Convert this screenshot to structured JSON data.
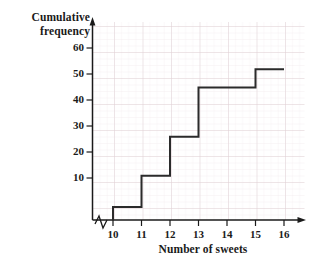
{
  "chart_data": {
    "type": "line",
    "subtype": "cumulative-frequency-step",
    "title": "",
    "xlabel": "Number of sweets",
    "ylabel": "Cumulative frequency",
    "ylabel_lines": [
      "Cumulative",
      "frequency"
    ],
    "x": [
      10,
      11,
      12,
      13,
      14,
      15,
      16
    ],
    "values": [
      5,
      17,
      32,
      51,
      51,
      58,
      58
    ],
    "points": [
      {
        "x": 10,
        "y": 5
      },
      {
        "x": 11,
        "y": 17
      },
      {
        "x": 12,
        "y": 32
      },
      {
        "x": 13,
        "y": 51
      },
      {
        "x": 15,
        "y": 58
      }
    ],
    "step_segments": [
      {
        "from_x": 10,
        "to_x": 11,
        "y": 5
      },
      {
        "from_x": 11,
        "to_x": 12,
        "y": 17
      },
      {
        "from_x": 12,
        "to_x": 13,
        "y": 32
      },
      {
        "from_x": 13,
        "to_x": 15,
        "y": 51
      },
      {
        "from_x": 15,
        "to_x": 16,
        "y": 58
      }
    ],
    "xticks": [
      "10",
      "11",
      "12",
      "13",
      "14",
      "15",
      "16"
    ],
    "yticks": [
      "10",
      "20",
      "30",
      "40",
      "50",
      "60"
    ],
    "xlim": [
      9.5,
      16.7
    ],
    "ylim": [
      0,
      66
    ],
    "grid": true,
    "grid_major": true,
    "grid_minor": true,
    "legend": null,
    "axis_break": "x-axis zigzag break near origin",
    "colors": {
      "line": "#2b2b2b",
      "axis": "#1a1a1a",
      "grid_major": "#d9c9cc",
      "grid_minor": "#ece3e5",
      "text": "#1a1a1a",
      "background": "#ffffff"
    }
  },
  "axes": {
    "y_label_line1": "Cumulative",
    "y_label_line2": "frequency",
    "x_label": "Number of sweets",
    "y_ticks": [
      {
        "label": "60"
      },
      {
        "label": "50"
      },
      {
        "label": "40"
      },
      {
        "label": "30"
      },
      {
        "label": "20"
      },
      {
        "label": "10"
      }
    ],
    "x_ticks": [
      {
        "label": "10"
      },
      {
        "label": "11"
      },
      {
        "label": "12"
      },
      {
        "label": "13"
      },
      {
        "label": "14"
      },
      {
        "label": "15"
      },
      {
        "label": "16"
      }
    ]
  }
}
